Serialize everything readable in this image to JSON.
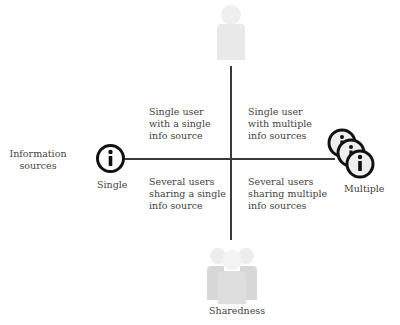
{
  "diagram": {
    "x_axis": {
      "title": "Information sources",
      "left_label": "Single",
      "right_label": "Multiple",
      "left_icon": "info-icon",
      "right_icon": "stacked-info-icons"
    },
    "y_axis": {
      "title": "Sharedness",
      "top_icon": "single-user-icon",
      "bottom_icon": "group-users-icon"
    },
    "quadrants": {
      "top_left": "Single user\nwith a single\ninfo source",
      "top_right": "Single user\nwith multiple\ninfo sources",
      "bottom_left": "Several users\nsharing a single\ninfo source",
      "bottom_right": "Several users\nsharing multiple\ninfo sources"
    },
    "colors": {
      "axis": "#3a3a3a",
      "text": "#444444",
      "user_icon": "#e6e6e6",
      "info_icon_stroke": "#111111",
      "info_icon_fill": "#eeeeee"
    }
  }
}
